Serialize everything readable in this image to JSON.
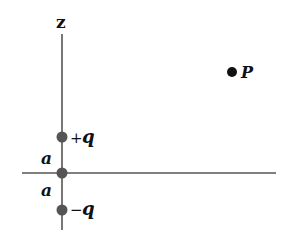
{
  "diagram": {
    "axis_label": "z",
    "charges": [
      {
        "label": "+q",
        "sign": "+",
        "symbol": "q"
      },
      {
        "label": "-q",
        "sign": "−",
        "symbol": "q"
      }
    ],
    "distance_label_upper": "a",
    "distance_label_lower": "a",
    "point_label": "P",
    "colors": {
      "axis": "#555555",
      "charge": "#555555",
      "point": "#111111"
    }
  }
}
